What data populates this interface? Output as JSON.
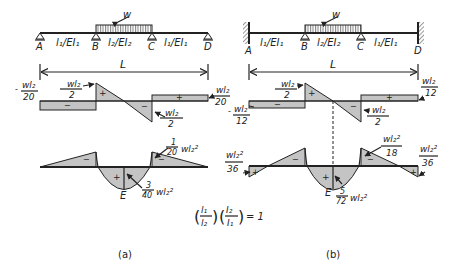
{
  "figure": {
    "panels": [
      {
        "id": "a",
        "caption": "(a)",
        "supports": [
          "A",
          "B",
          "C",
          "D"
        ],
        "support_type": "pinned-rollers",
        "span_labels": [
          "l₁/EI₁",
          "l₂/EI₂",
          "l₁/EI₁"
        ],
        "load_label": "w",
        "length_label": "L",
        "shear": {
          "left_value": {
            "sign": "-",
            "num": "wl₂",
            "den": "20"
          },
          "peak_left": {
            "num": "wl₂",
            "den": "2"
          },
          "peak_right": {
            "sign": "-",
            "num": "wl₂",
            "den": "2"
          },
          "right_value": {
            "num": "wl₂",
            "den": "20"
          },
          "signs": [
            "−",
            "+",
            "−",
            "+"
          ]
        },
        "moment": {
          "support_moment": {
            "coef_num": "1",
            "coef_den": "20",
            "term": "wl₂²"
          },
          "midspan_moment": {
            "coef_num": "3",
            "coef_den": "40",
            "term": "wl₂²"
          },
          "point_label": "E",
          "signs": [
            "−",
            "+",
            "−"
          ]
        }
      },
      {
        "id": "b",
        "caption": "(b)",
        "supports": [
          "A",
          "B",
          "C",
          "D"
        ],
        "support_type": "fixed-ends-with-interior-rollers",
        "span_labels": [
          "l₁/EI₁",
          "l₂/EI₂",
          "l₁/EI₁"
        ],
        "load_label": "w",
        "length_label": "L",
        "shear": {
          "left_value": {
            "sign": "-",
            "num": "wl₂",
            "den": "12"
          },
          "peak_left": {
            "num": "wl₂",
            "den": "2"
          },
          "peak_right": {
            "sign": "-",
            "num": "wl₂",
            "den": "2"
          },
          "right_value": {
            "num": "wl₂",
            "den": "12"
          },
          "signs": [
            "−",
            "+",
            "−",
            "+"
          ]
        },
        "moment": {
          "end_moment_left": {
            "num": "wl₂²",
            "den": "36"
          },
          "end_moment_right": {
            "num": "wl₂²",
            "den": "36"
          },
          "support_moment": {
            "num": "wl₂²",
            "den": "18"
          },
          "midspan_moment": {
            "coef_num": "5",
            "coef_den": "72",
            "term": "wl₂²"
          },
          "point_label": "E",
          "signs": [
            "+",
            "−",
            "+",
            "−",
            "+"
          ]
        }
      }
    ],
    "condition": {
      "f1_num": "l₁",
      "f1_den": "l₂",
      "f2_num": "I₂",
      "f2_den": "I₁",
      "rhs": "= 1"
    }
  }
}
